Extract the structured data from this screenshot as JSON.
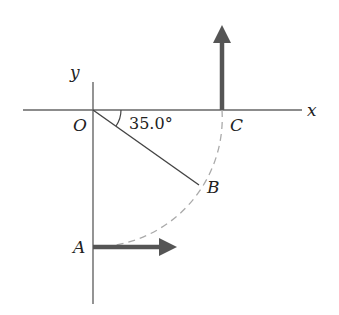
{
  "diagram": {
    "axes": {
      "x_label": "x",
      "y_label": "y"
    },
    "points": {
      "origin": "O",
      "A": "A",
      "B": "B",
      "C": "C"
    },
    "angle_label": "35.0°",
    "colors": {
      "axis": "#555555",
      "arrow": "#555555",
      "dashed_arc": "#aaaaaa",
      "text": "#222222"
    }
  }
}
